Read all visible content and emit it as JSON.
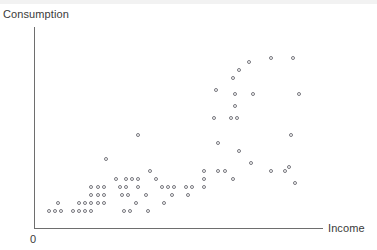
{
  "chart_data": {
    "type": "scatter",
    "title": "",
    "xlabel": "Income",
    "ylabel": "Consumption",
    "origin_label": "0",
    "grid": false,
    "legend": null,
    "axis_color": "#6e6e6e",
    "marker_color": "#77777e",
    "marker_style": "open-circle",
    "xlim": [
      0,
      100
    ],
    "ylim": [
      0,
      100
    ],
    "axis_ticks": [],
    "points": [
      {
        "x": 5.6,
        "y": 8.0
      },
      {
        "x": 7.7,
        "y": 8.0
      },
      {
        "x": 9.8,
        "y": 8.0
      },
      {
        "x": 14.0,
        "y": 8.0
      },
      {
        "x": 16.1,
        "y": 8.0
      },
      {
        "x": 18.2,
        "y": 8.0
      },
      {
        "x": 20.3,
        "y": 8.0
      },
      {
        "x": 31.5,
        "y": 8.0
      },
      {
        "x": 33.6,
        "y": 8.0
      },
      {
        "x": 39.9,
        "y": 8.0
      },
      {
        "x": 8.7,
        "y": 12.0
      },
      {
        "x": 16.1,
        "y": 12.0
      },
      {
        "x": 18.2,
        "y": 12.0
      },
      {
        "x": 20.3,
        "y": 12.0
      },
      {
        "x": 22.4,
        "y": 12.0
      },
      {
        "x": 24.5,
        "y": 12.0
      },
      {
        "x": 35.7,
        "y": 12.0
      },
      {
        "x": 45.5,
        "y": 12.0
      },
      {
        "x": 20.3,
        "y": 16.0
      },
      {
        "x": 22.4,
        "y": 16.0
      },
      {
        "x": 24.5,
        "y": 16.0
      },
      {
        "x": 30.8,
        "y": 16.0
      },
      {
        "x": 32.9,
        "y": 16.0
      },
      {
        "x": 39.2,
        "y": 16.0
      },
      {
        "x": 48.3,
        "y": 16.0
      },
      {
        "x": 53.9,
        "y": 16.0
      },
      {
        "x": 20.3,
        "y": 20.0
      },
      {
        "x": 22.4,
        "y": 20.0
      },
      {
        "x": 24.5,
        "y": 20.0
      },
      {
        "x": 30.1,
        "y": 20.0
      },
      {
        "x": 32.2,
        "y": 20.0
      },
      {
        "x": 36.4,
        "y": 20.0
      },
      {
        "x": 44.8,
        "y": 20.0
      },
      {
        "x": 46.9,
        "y": 20.0
      },
      {
        "x": 49.0,
        "y": 20.0
      },
      {
        "x": 53.2,
        "y": 20.0
      },
      {
        "x": 55.3,
        "y": 20.0
      },
      {
        "x": 59.5,
        "y": 20.0
      },
      {
        "x": 28.7,
        "y": 24.0
      },
      {
        "x": 32.2,
        "y": 24.0
      },
      {
        "x": 34.3,
        "y": 24.0
      },
      {
        "x": 36.4,
        "y": 24.0
      },
      {
        "x": 42.7,
        "y": 24.0
      },
      {
        "x": 59.5,
        "y": 24.0
      },
      {
        "x": 69.3,
        "y": 24.0
      },
      {
        "x": 40.6,
        "y": 28.0
      },
      {
        "x": 59.5,
        "y": 28.0
      },
      {
        "x": 64.4,
        "y": 28.0
      },
      {
        "x": 66.5,
        "y": 28.0
      },
      {
        "x": 82.6,
        "y": 28.0
      },
      {
        "x": 87.5,
        "y": 28.0
      },
      {
        "x": 88.9,
        "y": 30.0
      },
      {
        "x": 91.0,
        "y": 22.0
      },
      {
        "x": 25.2,
        "y": 34.0
      },
      {
        "x": 75.6,
        "y": 32.0
      },
      {
        "x": 36.4,
        "y": 46.0
      },
      {
        "x": 64.4,
        "y": 42.0
      },
      {
        "x": 71.4,
        "y": 38.0
      },
      {
        "x": 89.6,
        "y": 46.0
      },
      {
        "x": 63.0,
        "y": 54.0
      },
      {
        "x": 68.6,
        "y": 54.0
      },
      {
        "x": 70.7,
        "y": 54.0
      },
      {
        "x": 70.0,
        "y": 60.0
      },
      {
        "x": 63.7,
        "y": 68.0
      },
      {
        "x": 70.0,
        "y": 66.0
      },
      {
        "x": 76.3,
        "y": 66.0
      },
      {
        "x": 92.4,
        "y": 66.0
      },
      {
        "x": 69.3,
        "y": 74.0
      },
      {
        "x": 71.4,
        "y": 78.0
      },
      {
        "x": 74.9,
        "y": 82.0
      },
      {
        "x": 82.6,
        "y": 84.0
      },
      {
        "x": 90.3,
        "y": 84.0
      }
    ]
  }
}
